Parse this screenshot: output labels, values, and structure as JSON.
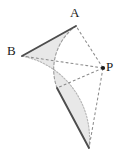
{
  "figure": {
    "kind": "geometry-diagram",
    "canvas": {
      "width": 122,
      "height": 160,
      "background": "#ffffff"
    },
    "colors": {
      "shaded_region_fill": "#e8e8e8",
      "shaded_region_stroke": "#c8c8c8",
      "solid_line": "#4d4d4d",
      "dashed_line": "#8c8c8c",
      "label_text": "#1a1a1a",
      "point_marker": "#1a1a1a"
    },
    "labels": {
      "a": "A",
      "b": "B",
      "p": "P"
    },
    "points": [
      {
        "name": "A",
        "label": "A",
        "x": 76,
        "y": 26,
        "marker": false
      },
      {
        "name": "B",
        "label": "B",
        "x": 22,
        "y": 56,
        "marker": false
      },
      {
        "name": "P",
        "label": "P",
        "x": 103,
        "y": 68,
        "marker": true
      },
      {
        "name": "A-image",
        "label": "",
        "x": 57,
        "y": 88,
        "marker": false
      },
      {
        "name": "B-image",
        "label": "",
        "x": 89,
        "y": 148,
        "marker": false
      },
      {
        "name": "inner-arc-mid",
        "label": "",
        "x": 52,
        "y": 58,
        "marker": false
      }
    ],
    "segments": [
      {
        "name": "chord-BA",
        "style": "solid",
        "from": "B",
        "to": "A"
      },
      {
        "name": "chord-image",
        "style": "solid",
        "from": "A-image",
        "to": "B-image"
      },
      {
        "name": "radius-PA",
        "style": "dashed",
        "from": "P",
        "to": "A"
      },
      {
        "name": "radius-PB",
        "style": "dashed",
        "from": "P",
        "to": "B"
      },
      {
        "name": "radius-PA-image",
        "style": "dashed",
        "from": "P",
        "to": "A-image"
      },
      {
        "name": "radius-PB-image",
        "style": "dashed",
        "from": "P",
        "to": "B-image"
      }
    ],
    "arcs": [
      {
        "name": "outer-arc-B-to-Bimage",
        "style": "dotted",
        "from": "B",
        "to": "B-image"
      },
      {
        "name": "inner-arc-A-to-Aimage",
        "style": "dashed",
        "from": "A",
        "to": "A-image"
      }
    ],
    "regions": [
      {
        "name": "swept-region",
        "fill": "#e8e8e8",
        "description": "Shaded crescent swept by segment AB rotating about P"
      }
    ]
  }
}
